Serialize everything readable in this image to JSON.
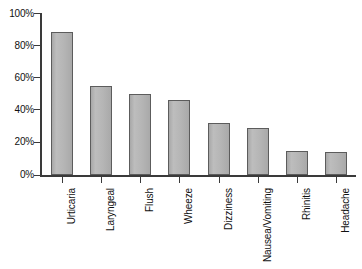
{
  "chart_data": {
    "type": "bar",
    "title": "",
    "subtitle": "",
    "xlabel": "",
    "ylabel": "",
    "categories": [
      "Urticaria",
      "Laryngeal",
      "Flush",
      "Wheeze",
      "Dizziness",
      "Nausea/Vomiting",
      "Rhinitis",
      "Headache"
    ],
    "values": [
      88,
      55,
      50,
      46,
      32,
      29,
      15,
      14
    ],
    "value_unit": "%",
    "ylim": [
      0,
      100
    ],
    "ytick_labels": [
      "0%",
      "20%",
      "40%",
      "60%",
      "80%",
      "100%"
    ],
    "ytick_values": [
      0,
      20,
      40,
      60,
      80,
      100
    ],
    "grid": false,
    "legend": null,
    "legend_position": "none",
    "annotations": []
  },
  "style": {
    "bar_fill": "#b3b3b3",
    "bar_stroke": "#5c5c5c",
    "axis_color": "#3a3a3a",
    "text_color": "#111111",
    "background": "#ffffff"
  }
}
